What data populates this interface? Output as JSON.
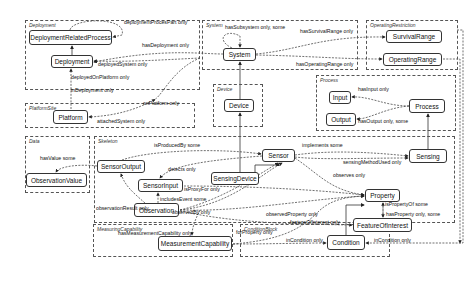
{
  "groups": [
    {
      "id": "deployment",
      "label": "Deployment",
      "x": 25,
      "y": 20,
      "w": 175,
      "h": 70
    },
    {
      "id": "system",
      "label": "System",
      "x": 202,
      "y": 20,
      "w": 156,
      "h": 50
    },
    {
      "id": "operating_restriction",
      "label": "OperatingRestriction",
      "x": 366,
      "y": 20,
      "w": 92,
      "h": 50
    },
    {
      "id": "platform_site",
      "label": "PlatformSite",
      "x": 25,
      "y": 103,
      "w": 170,
      "h": 25
    },
    {
      "id": "device",
      "label": "Device",
      "x": 213,
      "y": 84,
      "w": 50,
      "h": 43
    },
    {
      "id": "process",
      "label": "Process",
      "x": 316,
      "y": 75,
      "w": 140,
      "h": 56
    },
    {
      "id": "data",
      "label": "Data",
      "x": 25,
      "y": 136,
      "w": 65,
      "h": 57
    },
    {
      "id": "skeleton",
      "label": "Skeleton",
      "x": 94,
      "y": 136,
      "w": 361,
      "h": 87
    },
    {
      "id": "measuring_capability",
      "label": "MeasuringCapability",
      "x": 93,
      "y": 224,
      "w": 140,
      "h": 33
    },
    {
      "id": "condition_block",
      "label": "ConditionBlock",
      "x": 240,
      "y": 224,
      "w": 150,
      "h": 33
    }
  ],
  "nodes": [
    {
      "id": "DeploymentRelatedProcess",
      "label": "DeploymentRelatedProcess",
      "x": 29,
      "y": 30,
      "w": 83,
      "h": 15
    },
    {
      "id": "Deployment",
      "label": "Deployment",
      "x": 51,
      "y": 55,
      "w": 42,
      "h": 13
    },
    {
      "id": "System",
      "label": "System",
      "x": 223,
      "y": 48,
      "w": 33,
      "h": 13
    },
    {
      "id": "SurvivalRange",
      "label": "SurvivalRange",
      "x": 386,
      "y": 30,
      "w": 56,
      "h": 13
    },
    {
      "id": "OperatingRange",
      "label": "OperatingRange",
      "x": 383,
      "y": 53,
      "w": 59,
      "h": 13
    },
    {
      "id": "Platform",
      "label": "Platform",
      "x": 53,
      "y": 110,
      "w": 35,
      "h": 14
    },
    {
      "id": "Device",
      "label": "Device",
      "x": 224,
      "y": 99,
      "w": 30,
      "h": 13
    },
    {
      "id": "Input",
      "label": "Input",
      "x": 329,
      "y": 91,
      "w": 22,
      "h": 13
    },
    {
      "id": "Process",
      "label": "Process",
      "x": 409,
      "y": 99,
      "w": 36,
      "h": 14
    },
    {
      "id": "Output",
      "label": "Output",
      "x": 326,
      "y": 113,
      "w": 30,
      "h": 13
    },
    {
      "id": "SensorOutput",
      "label": "SensorOutput",
      "x": 97,
      "y": 160,
      "w": 48,
      "h": 13
    },
    {
      "id": "ObservationValue",
      "label": "ObservationValue",
      "x": 26,
      "y": 173,
      "w": 61,
      "h": 14
    },
    {
      "id": "Sensor",
      "label": "Sensor",
      "x": 262,
      "y": 149,
      "w": 33,
      "h": 13
    },
    {
      "id": "Sensing",
      "label": "Sensing",
      "x": 409,
      "y": 149,
      "w": 38,
      "h": 14
    },
    {
      "id": "SensorInput",
      "label": "SensorInput",
      "x": 138,
      "y": 179,
      "w": 45,
      "h": 13
    },
    {
      "id": "SensingDevice",
      "label": "SensingDevice",
      "x": 211,
      "y": 172,
      "w": 48,
      "h": 13
    },
    {
      "id": "Property",
      "label": "Property",
      "x": 365,
      "y": 189,
      "w": 35,
      "h": 13
    },
    {
      "id": "Observation",
      "label": "Observation",
      "x": 134,
      "y": 203,
      "w": 45,
      "h": 14
    },
    {
      "id": "FeatureOfInterest",
      "label": "FeatureOfInterest",
      "x": 353,
      "y": 218,
      "w": 59,
      "h": 14
    },
    {
      "id": "MeasurementCapability",
      "label": "MeasurementCapability",
      "x": 158,
      "y": 236,
      "w": 74,
      "h": 15
    },
    {
      "id": "Condition",
      "label": "Condition",
      "x": 327,
      "y": 235,
      "w": 38,
      "h": 15
    }
  ],
  "edge_labels": [
    {
      "text": "deploymentProcesPart only",
      "x": 124,
      "y": 22
    },
    {
      "text": "hasDeployment only",
      "x": 142,
      "y": 45
    },
    {
      "text": "deployedSystem only",
      "x": 98,
      "y": 63
    },
    {
      "text": "deployedOnPlatform only",
      "x": 71,
      "y": 76
    },
    {
      "text": "inDeployment only",
      "x": 71,
      "y": 89
    },
    {
      "text": "hasSubsystem only, some",
      "x": 225,
      "y": 26
    },
    {
      "text": "hasSurvivalRange only",
      "x": 300,
      "y": 31
    },
    {
      "text": "hasOperatingRange only",
      "x": 296,
      "y": 61
    },
    {
      "text": "onPlatform only",
      "x": 143,
      "y": 103
    },
    {
      "text": "attachedSystem only",
      "x": 97,
      "y": 121
    },
    {
      "text": "hasInput only",
      "x": 358,
      "y": 89
    },
    {
      "text": "hasOutput only, some",
      "x": 358,
      "y": 120
    },
    {
      "text": "hasValue some",
      "x": 40,
      "y": 157
    },
    {
      "text": "isProducedBy some",
      "x": 154,
      "y": 144
    },
    {
      "text": "implements some",
      "x": 302,
      "y": 144
    },
    {
      "text": "sensingMethodUsed only",
      "x": 343,
      "y": 159
    },
    {
      "text": "detects only",
      "x": 168,
      "y": 169
    },
    {
      "text": "observes only",
      "x": 333,
      "y": 173
    },
    {
      "text": "isProxyFor only",
      "x": 184,
      "y": 185
    },
    {
      "text": "includesEvent some",
      "x": 160,
      "y": 202
    },
    {
      "text": "observationResult only",
      "x": 96,
      "y": 208
    },
    {
      "text": "observedBy only",
      "x": 172,
      "y": 212
    },
    {
      "text": "observedProperty only",
      "x": 266,
      "y": 208
    },
    {
      "text": "isPropertyOf some",
      "x": 385,
      "y": 203
    },
    {
      "text": "hasProperty only, some",
      "x": 386,
      "y": 211
    },
    {
      "text": "featureOfInterest only",
      "x": 290,
      "y": 233
    },
    {
      "text": "hasMeasurementCapability only",
      "x": 118,
      "y": 227
    },
    {
      "text": "forProperty only",
      "x": 236,
      "y": 231
    },
    {
      "text": "inCondition only",
      "x": 286,
      "y": 239
    },
    {
      "text": "inCondition only",
      "x": 374,
      "y": 239
    }
  ],
  "colors": {
    "stroke": "#333333",
    "group_border": "#555555",
    "background": "#ffffff"
  }
}
